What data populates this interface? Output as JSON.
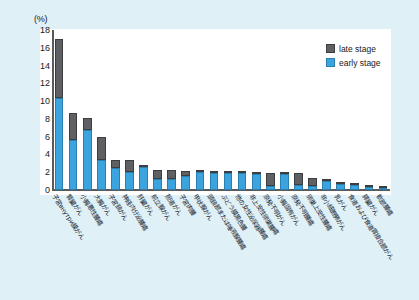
{
  "chart_data": {
    "type": "bar",
    "subtype": "stacked",
    "title": "",
    "xlabel": "",
    "ylabel": "(%)",
    "ylim": [
      0,
      18
    ],
    "yticks": [
      0,
      2,
      4,
      6,
      8,
      10,
      12,
      14,
      16,
      18
    ],
    "ytick_labels": [
      "0",
      "2",
      "4",
      "6",
      "8",
      "10",
      "12",
      "14",
      "16",
      "18"
    ],
    "grid": false,
    "legend_position": "top-right",
    "legend": [
      "late stage",
      "early stage"
    ],
    "colors": {
      "late_stage": "#5f6063",
      "early_stage": "#3ba3dd",
      "page_background": "#dff0f7",
      "plot_background": "#ffffff",
      "axis": "#5a5a5a",
      "text": "#15202b"
    },
    "categories": [
      "子宮внутри膜がん",
      "腎臓がん",
      "小腸悪性腫瘍",
      "大腸がん",
      "子宮頸がん",
      "神経内分泌腫瘍",
      "肝臓がん",
      "前立腺がん",
      "胆道がん",
      "子宮肉腫",
      "甲状腺がん",
      "頭頸部または唾液腺腫瘍",
      "ぶどう膜黒色腫",
      "他の女性泌尿器腫瘍",
      "非上皮性卵巣腫瘍",
      "原発不明がん",
      "小腸固有がん",
      "原発不明腫瘍",
      "卵巣上皮性腫瘍",
      "非小細胞肺がん",
      "乳がん",
      "食道および食道胃接合部がん",
      "膵臓がん",
      "軟部腫瘍"
    ],
    "series": [
      {
        "name": "early stage",
        "values": [
          10.3,
          5.6,
          6.8,
          3.4,
          2.5,
          2.0,
          2.6,
          1.2,
          1.2,
          1.6,
          2.2,
          1.9,
          2.0,
          2.0,
          1.8,
          0.5,
          1.9,
          0.6,
          0.4,
          1.0,
          0.7,
          0.6,
          0.3,
          0.4
        ]
      },
      {
        "name": "late stage",
        "values": [
          6.7,
          3.1,
          1.3,
          2.6,
          0.9,
          1.4,
          0.2,
          1.1,
          1.0,
          0.5,
          0.1,
          0.2,
          0.1,
          0.1,
          0.2,
          1.4,
          0.1,
          1.3,
          1.0,
          0.2,
          0.2,
          0.2,
          0.3,
          0.1
        ]
      }
    ],
    "totals": [
      17.0,
      8.7,
      8.1,
      6.0,
      3.4,
      3.4,
      2.8,
      2.3,
      2.2,
      2.1,
      2.3,
      2.1,
      2.1,
      2.1,
      2.0,
      1.9,
      2.0,
      1.9,
      1.4,
      1.2,
      0.9,
      0.8,
      0.6,
      0.5
    ]
  },
  "axis": {
    "unit_label": "(%)"
  },
  "legend": {
    "items": [
      {
        "label": "late stage",
        "color": "#5f6063"
      },
      {
        "label": "early stage",
        "color": "#3ba3dd"
      }
    ]
  }
}
